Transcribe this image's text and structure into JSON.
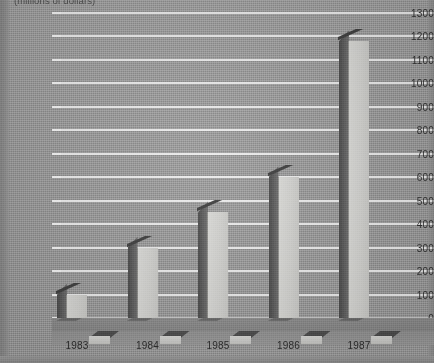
{
  "chart_data": {
    "type": "bar",
    "title": "(millions of dollars)",
    "subtitle": "",
    "xlabel": "",
    "ylabel": "",
    "categories": [
      "1983",
      "1984",
      "1985",
      "1986",
      "1987"
    ],
    "values": [
      100,
      300,
      450,
      600,
      1180
    ],
    "back_corner_values": [
      110,
      315,
      480,
      620,
      1230
    ],
    "ylim": [
      0,
      1300
    ],
    "ytick_labels": [
      "0",
      "100",
      "200",
      "300",
      "400",
      "500",
      "600",
      "700",
      "800",
      "900",
      "1000",
      "1100",
      "1200",
      "1300"
    ],
    "ytick_values": [
      0,
      100,
      200,
      300,
      400,
      500,
      600,
      700,
      800,
      900,
      1000,
      1100,
      1200,
      1300
    ],
    "ytick_step": 100,
    "grid": true,
    "grid_color": "#f2f2f2",
    "legend": false,
    "legend_position": "none",
    "style": "3d-bar",
    "bar_face_color": "#d4d4d1",
    "bar_edge_color": "#4a4a4a",
    "background_color": "#9c9c9c",
    "floor_color": "#8a8a8a",
    "text_color": "#2f2f2f",
    "annotations": []
  }
}
